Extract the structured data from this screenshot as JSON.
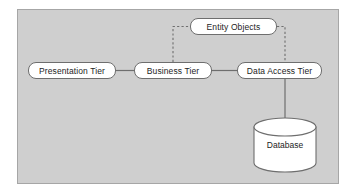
{
  "diagram": {
    "background_color": "#cfcfcf",
    "frame_border_color": "#a6a6a6",
    "node_fill_color": "#ffffff",
    "node_border_color": "#6e6e6e",
    "connector_color": "#6e6e6e",
    "nodes": {
      "presentation_tier": {
        "label": "Presentation Tier",
        "shape": "rounded-rect"
      },
      "business_tier": {
        "label": "Business Tier",
        "shape": "rounded-rect"
      },
      "data_access_tier": {
        "label": "Data Access Tier",
        "shape": "rounded-rect"
      },
      "entity_objects": {
        "label": "Entity Objects",
        "shape": "rounded-rect"
      },
      "database": {
        "label": "Database",
        "shape": "cylinder"
      }
    },
    "connectors": [
      {
        "from": "presentation_tier",
        "to": "business_tier",
        "style": "solid",
        "orientation": "horizontal"
      },
      {
        "from": "business_tier",
        "to": "data_access_tier",
        "style": "solid",
        "orientation": "horizontal"
      },
      {
        "from": "business_tier",
        "to": "entity_objects",
        "style": "dashed",
        "orientation": "elbow"
      },
      {
        "from": "entity_objects",
        "to": "data_access_tier",
        "style": "dashed",
        "orientation": "elbow"
      },
      {
        "from": "data_access_tier",
        "to": "database",
        "style": "solid",
        "orientation": "vertical"
      }
    ]
  }
}
